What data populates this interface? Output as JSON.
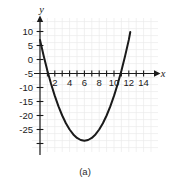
{
  "figure": {
    "caption": "(a)",
    "x_axis_name": "x",
    "y_axis_name": "y"
  },
  "chart_data": {
    "type": "line",
    "title": "",
    "subtitle": "",
    "xlabel": "x",
    "ylabel": "y",
    "caption": "(a)",
    "curve_label": "parabola",
    "equation": "y = x^2 - 12x + 12",
    "grid": true,
    "grid_color": "#e9e9e9",
    "curve_color": "#1a1a1a",
    "axis_color": "#1a1a1a",
    "legend": "none",
    "xlim": [
      -1.2,
      15.2
    ],
    "ylim": [
      -26.5,
      13.0
    ],
    "x_tick_labels": [
      "2",
      "4",
      "6",
      "8",
      "10",
      "12",
      "14"
    ],
    "x_tick_values": [
      2,
      4,
      6,
      8,
      10,
      12,
      14
    ],
    "x_minor_ticks": [
      1,
      2,
      3,
      4,
      5,
      6,
      7,
      8,
      9,
      10,
      11,
      12,
      13,
      14
    ],
    "y_tick_labels": [
      "10",
      "5",
      "0",
      "-5",
      "-10",
      "-15",
      "-20",
      "-25"
    ],
    "y_tick_values": [
      10,
      5,
      0,
      -5,
      -10,
      -15,
      -20,
      -25
    ],
    "vertex": [
      6,
      -24
    ],
    "x_intercepts": [
      1.1,
      10.9
    ],
    "y_intercept": 12,
    "x": [
      0.0,
      0.5,
      1.0,
      1.5,
      2.0,
      2.5,
      3.0,
      3.5,
      4.0,
      4.5,
      5.0,
      5.5,
      6.0,
      6.5,
      7.0,
      7.5,
      8.0,
      8.5,
      9.0,
      9.5,
      10.0,
      10.5,
      11.0,
      11.5,
      12.0,
      12.2
    ],
    "y": [
      12.0,
      6.25,
      1.0,
      -3.75,
      -8.0,
      -11.75,
      -15.0,
      -17.75,
      -20.0,
      -21.75,
      -23.0,
      -23.75,
      -24.0,
      -23.75,
      -23.0,
      -21.75,
      -20.0,
      -17.75,
      -15.0,
      -11.75,
      -8.0,
      -3.75,
      1.0,
      6.25,
      12.0,
      14.84
    ]
  }
}
